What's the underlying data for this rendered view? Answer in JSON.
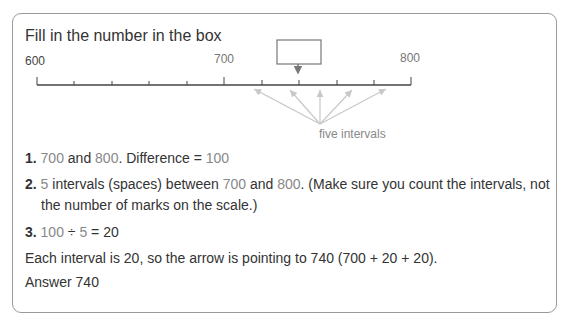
{
  "title": "Fill in the number in the box",
  "number_line": {
    "start_label": "600",
    "mid_label": "700",
    "end_label": "800",
    "caption": "five intervals",
    "box_value": ""
  },
  "steps": [
    {
      "num": "1.",
      "a": "700",
      "t1": " and ",
      "b": "800",
      "t2": ". Difference = ",
      "c": "100"
    },
    {
      "num": "2.",
      "a": "5",
      "t1": " intervals (spaces) between ",
      "b": "700",
      "t2": " and ",
      "c": "800",
      "t3": ". (Make sure you count the intervals, not",
      "line2": "the number of marks on the scale.)"
    },
    {
      "num": "3.",
      "a": "100",
      "t1": " ÷ ",
      "b": "5",
      "t2": " = 20"
    }
  ],
  "explanation": "Each interval is 20, so the arrow is pointing to 740 (700 + 20 + 20).",
  "answer": "Answer 740"
}
